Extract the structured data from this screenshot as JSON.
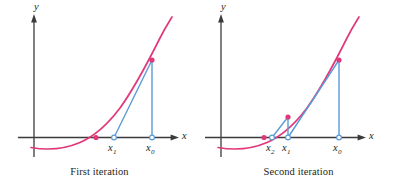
{
  "figure": {
    "title": "",
    "background_color": "#ffffff",
    "curve_color": "#e0387a",
    "secant_color": "#5b9bd5",
    "axis_color": "#3b3b3b",
    "text_color": "#231f20",
    "marker_fill_color": "#e0387a",
    "marker_open_color": "#5b9bd5"
  },
  "panels": [
    {
      "id": "first-iteration",
      "caption": "First iteration",
      "axes": {
        "y_label": "y",
        "x_label": "x"
      },
      "tick_labels": [
        {
          "name": "x1",
          "base": "x",
          "sub": "1"
        },
        {
          "name": "x0",
          "base": "x",
          "sub": "0"
        }
      ]
    },
    {
      "id": "second-iteration",
      "caption": "Second iteration",
      "axes": {
        "y_label": "y",
        "x_label": "x"
      },
      "tick_labels": [
        {
          "name": "x2",
          "base": "x",
          "sub": "2"
        },
        {
          "name": "x1",
          "base": "x",
          "sub": "1"
        },
        {
          "name": "x0",
          "base": "x",
          "sub": "0"
        }
      ]
    }
  ],
  "chart_data": {
    "type": "line",
    "xlabel": "x",
    "ylabel": "y",
    "grid": false,
    "legend": "none",
    "panels": [
      {
        "name": "First iteration",
        "caption": "First iteration",
        "xlim": [
          -0.55,
          2.35
        ],
        "ylim": [
          -0.35,
          2.6
        ],
        "series": [
          {
            "name": "f(x) curve",
            "type": "line",
            "color": "#e0387a",
            "x": [
              -0.5,
              -0.25,
              0.0,
              0.25,
              0.5,
              0.75,
              1.0,
              1.25,
              1.5,
              1.75,
              2.0,
              2.15
            ],
            "y": [
              -0.19,
              -0.21,
              -0.2,
              -0.15,
              -0.06,
              0.08,
              0.28,
              0.55,
              0.9,
              1.33,
              1.86,
              2.22
            ]
          },
          {
            "name": "secant line x1-x0",
            "type": "line",
            "color": "#5b9bd5",
            "x": [
              1.1,
              1.88
            ],
            "y": [
              0.0,
              1.68
            ]
          },
          {
            "name": "vertical ordinate at x0",
            "type": "line",
            "color": "#5b9bd5",
            "x": [
              1.88,
              1.88
            ],
            "y": [
              0.0,
              1.68
            ]
          }
        ],
        "points": [
          {
            "label": "root",
            "x": 0.86,
            "y": 0.0,
            "marker": "filled",
            "color": "#e0387a"
          },
          {
            "label": "(x0, f(x0))",
            "x": 1.88,
            "y": 1.68,
            "marker": "filled",
            "color": "#e0387a"
          },
          {
            "label": "x1",
            "x": 1.1,
            "y": 0.0,
            "marker": "open",
            "color": "#5b9bd5"
          },
          {
            "label": "x0",
            "x": 1.88,
            "y": 0.0,
            "marker": "open",
            "color": "#5b9bd5"
          }
        ],
        "tick_labels": [
          {
            "text": "x1",
            "x": 1.1
          },
          {
            "text": "x0",
            "x": 1.88
          }
        ]
      },
      {
        "name": "Second iteration",
        "caption": "Second iteration",
        "xlim": [
          -0.55,
          2.35
        ],
        "ylim": [
          -0.35,
          2.6
        ],
        "series": [
          {
            "name": "f(x) curve",
            "type": "line",
            "color": "#e0387a",
            "x": [
              -0.5,
              -0.25,
              0.0,
              0.25,
              0.5,
              0.75,
              1.0,
              1.25,
              1.5,
              1.75,
              2.0,
              2.15
            ],
            "y": [
              -0.19,
              -0.21,
              -0.2,
              -0.15,
              -0.06,
              0.08,
              0.28,
              0.55,
              0.9,
              1.33,
              1.86,
              2.22
            ]
          },
          {
            "name": "secant line x2-x1",
            "type": "line",
            "color": "#5b9bd5",
            "x": [
              0.8,
              1.12
            ],
            "y": [
              0.0,
              0.38
            ]
          },
          {
            "name": "vertical ordinate at x1",
            "type": "line",
            "color": "#5b9bd5",
            "x": [
              1.12,
              1.12
            ],
            "y": [
              0.0,
              0.38
            ]
          },
          {
            "name": "secant line x1-x0",
            "type": "line",
            "color": "#5b9bd5",
            "x": [
              1.12,
              1.88
            ],
            "y": [
              0.0,
              1.68
            ]
          },
          {
            "name": "vertical ordinate at x0",
            "type": "line",
            "color": "#5b9bd5",
            "x": [
              1.88,
              1.88
            ],
            "y": [
              0.0,
              1.68
            ]
          }
        ],
        "points": [
          {
            "label": "root",
            "x": 0.72,
            "y": 0.0,
            "marker": "filled",
            "color": "#e0387a"
          },
          {
            "label": "(x1, f(x1))",
            "x": 1.12,
            "y": 0.38,
            "marker": "filled",
            "color": "#e0387a"
          },
          {
            "label": "(x0, f(x0))",
            "x": 1.88,
            "y": 1.68,
            "marker": "filled",
            "color": "#e0387a"
          },
          {
            "label": "x2",
            "x": 0.88,
            "y": 0.0,
            "marker": "open",
            "color": "#5b9bd5"
          },
          {
            "label": "x1",
            "x": 1.12,
            "y": 0.0,
            "marker": "open",
            "color": "#5b9bd5"
          },
          {
            "label": "x0",
            "x": 1.88,
            "y": 0.0,
            "marker": "open",
            "color": "#5b9bd5"
          }
        ],
        "tick_labels": [
          {
            "text": "x2",
            "x": 0.88
          },
          {
            "text": "x1",
            "x": 1.12
          },
          {
            "text": "x0",
            "x": 1.88
          }
        ]
      }
    ]
  }
}
